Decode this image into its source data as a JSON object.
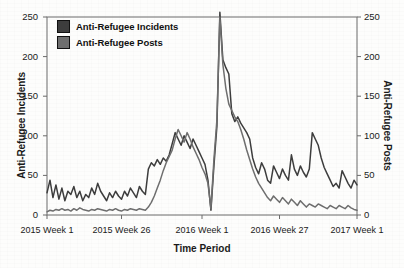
{
  "chart_data": {
    "type": "line",
    "title": "",
    "xlabel": "Time Period",
    "ylabel": "Anti-Refugee Incidents",
    "ylabel_right": "Anti-Refugee Posts",
    "ylim": [
      0,
      250
    ],
    "ylim_right": [
      0,
      250
    ],
    "yticks": [
      0,
      50,
      100,
      150,
      200,
      250
    ],
    "yticks_right": [
      0,
      50,
      100,
      150,
      200,
      250
    ],
    "xtick_labels": [
      "2015 Week 1",
      "2015 Week 26",
      "2016 Week 1",
      "2016 Week 27",
      "2017 Week 1"
    ],
    "xtick_positions": [
      0,
      25,
      52,
      78,
      104
    ],
    "grid": false,
    "legend_position": "upper left",
    "n_points": 105,
    "series": [
      {
        "name": "Anti-Refugee Incidents",
        "axis": "left",
        "color": "#3d3d3d",
        "values": [
          28,
          44,
          22,
          38,
          20,
          34,
          18,
          30,
          26,
          36,
          22,
          30,
          18,
          26,
          22,
          34,
          26,
          40,
          30,
          24,
          18,
          28,
          22,
          30,
          24,
          20,
          30,
          24,
          34,
          28,
          22,
          36,
          30,
          26,
          58,
          66,
          62,
          70,
          64,
          72,
          68,
          76,
          90,
          104,
          96,
          88,
          100,
          92,
          84,
          96,
          88,
          80,
          72,
          64,
          44,
          6,
          62,
          112,
          256,
          196,
          186,
          178,
          128,
          118,
          124,
          116,
          110,
          104,
          96,
          72,
          60,
          52,
          66,
          58,
          44,
          40,
          62,
          54,
          46,
          58,
          50,
          44,
          76,
          58,
          50,
          62,
          54,
          48,
          58,
          104,
          96,
          88,
          72,
          60,
          52,
          44,
          36,
          40,
          34,
          56,
          48,
          40,
          34,
          44,
          38
        ]
      },
      {
        "name": "Anti-Refugee Posts",
        "axis": "right",
        "color": "#6e6e6e",
        "values": [
          4,
          6,
          5,
          7,
          6,
          8,
          6,
          7,
          5,
          8,
          6,
          9,
          7,
          6,
          5,
          7,
          6,
          8,
          7,
          6,
          5,
          7,
          6,
          8,
          6,
          5,
          7,
          6,
          8,
          7,
          6,
          8,
          7,
          6,
          10,
          16,
          24,
          34,
          44,
          56,
          66,
          74,
          82,
          96,
          108,
          100,
          92,
          104,
          96,
          86,
          78,
          70,
          60,
          52,
          40,
          8,
          70,
          120,
          250,
          190,
          160,
          140,
          132,
          124,
          118,
          108,
          96,
          82,
          70,
          58,
          48,
          40,
          34,
          28,
          22,
          18,
          24,
          20,
          16,
          22,
          18,
          14,
          20,
          16,
          12,
          18,
          14,
          10,
          14,
          12,
          10,
          14,
          12,
          10,
          8,
          12,
          10,
          8,
          12,
          10,
          8,
          12,
          9,
          7,
          6
        ]
      }
    ]
  },
  "axes": {
    "left_label": "Anti-Refugee Incidents",
    "right_label": "Anti-Refugee Posts",
    "x_label": "Time Period"
  },
  "legend": {
    "items": [
      {
        "label": "Anti-Refugee Incidents",
        "color": "#3d3d3d"
      },
      {
        "label": "Anti-Refugee Posts",
        "color": "#6e6e6e"
      }
    ]
  },
  "colors": {
    "incidents": "#3d3d3d",
    "posts": "#6e6e6e",
    "axis": "#6b6b6b",
    "text": "#1a1a1a",
    "background": "#fdfdfc"
  }
}
